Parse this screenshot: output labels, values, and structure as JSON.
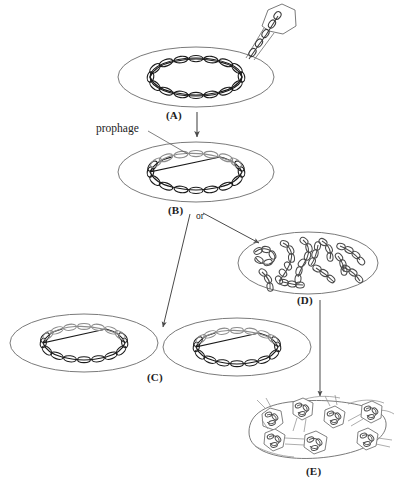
{
  "figure": {
    "background_color": "#ffffff",
    "ink_color": "#2b2b2b",
    "membrane_color": "#6b6b6b",
    "chromosome_color": "#1a1a1a",
    "prophage_color": "#8c8c8c",
    "arrow_color": "#4a4a4a"
  },
  "labels": {
    "panel_a": "(A)",
    "panel_b": "(B)",
    "panel_c": "(C)",
    "panel_d": "(D)",
    "panel_e": "(E)",
    "prophage": "prophage",
    "or": "or"
  },
  "panels": [
    {
      "id": "A",
      "label": "(A)",
      "caption": "Bacterium with circular chromosome; phage attached to cell surface injecting DNA",
      "cell_shape": "ellipse",
      "chromosome": "circular",
      "has_prophage": false,
      "phage_count": 1
    },
    {
      "id": "B",
      "label": "(B)",
      "caption": "Phage DNA integrated into bacterial chromosome as prophage",
      "cell_shape": "ellipse",
      "chromosome": "circular",
      "has_prophage": true,
      "phage_count": 0
    },
    {
      "id": "C",
      "label": "(C)",
      "caption": "Two daughter cells each carrying the prophage after cell division",
      "cell_shape": "ellipse",
      "chromosome": "circular",
      "has_prophage": true,
      "cell_count": 2
    },
    {
      "id": "D",
      "label": "(D)",
      "caption": "Prophage excises and phage DNA replicates; host chromosome degraded",
      "cell_shape": "ellipse",
      "chromosome": "fragmented-replicating",
      "has_prophage": false,
      "dna_strand_count": 11
    },
    {
      "id": "E",
      "label": "(E)",
      "caption": "Mature phage particles assembled; cell lyses releasing progeny phage",
      "cell_shape": "lysing-ellipse",
      "phage_count": 7
    }
  ],
  "annotations": [
    {
      "name": "prophage-callout",
      "text": "prophage",
      "points_to": "B"
    },
    {
      "name": "or-branch",
      "text": "or",
      "between": [
        "C",
        "D"
      ]
    }
  ],
  "arrows": [
    {
      "name": "arrow-a-to-b",
      "from": "A",
      "to": "B",
      "direction": "down"
    },
    {
      "name": "arrow-b-to-c",
      "from": "B",
      "to": "C",
      "direction": "down-left"
    },
    {
      "name": "arrow-b-to-d",
      "from": "B",
      "to": "D",
      "direction": "up-right"
    },
    {
      "name": "arrow-d-to-e",
      "from": "D",
      "to": "E",
      "direction": "down"
    }
  ]
}
